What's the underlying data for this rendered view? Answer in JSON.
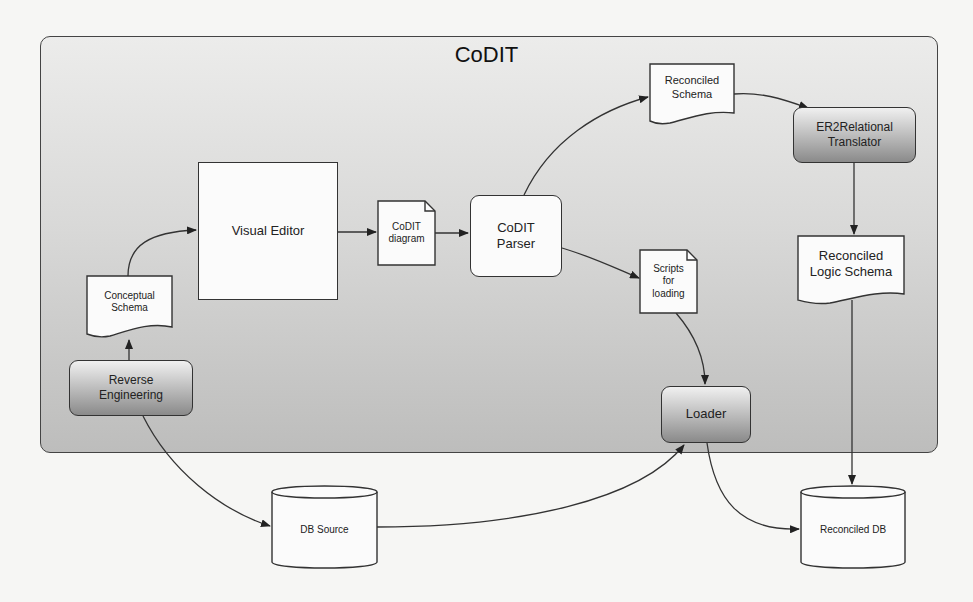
{
  "title": "CoDIT",
  "nodes": {
    "visual_editor": "Visual Editor",
    "codit_diagram": "CoDIT\ndiagram",
    "codit_parser": "CoDIT\nParser",
    "reconciled_schema": "Reconciled\nSchema",
    "er2relational_translator": "ER2Relational\nTranslator",
    "reconciled_logic_schema": "Reconciled\nLogic Schema",
    "scripts_for_loading": "Scripts\nfor\nloading",
    "loader": "Loader",
    "conceptual_schema": "Conceptual\nSchema",
    "reverse_engineering": "Reverse\nEngineering",
    "db_source": "DB Source",
    "reconciled_db": "Reconciled DB"
  },
  "edges": [
    {
      "from": "reverse_engineering",
      "to": "conceptual_schema"
    },
    {
      "from": "conceptual_schema",
      "to": "visual_editor"
    },
    {
      "from": "visual_editor",
      "to": "codit_diagram"
    },
    {
      "from": "codit_diagram",
      "to": "codit_parser"
    },
    {
      "from": "codit_parser",
      "to": "reconciled_schema"
    },
    {
      "from": "reconciled_schema",
      "to": "er2relational_translator"
    },
    {
      "from": "er2relational_translator",
      "to": "reconciled_logic_schema"
    },
    {
      "from": "reconciled_logic_schema",
      "to": "reconciled_db"
    },
    {
      "from": "codit_parser",
      "to": "scripts_for_loading"
    },
    {
      "from": "scripts_for_loading",
      "to": "loader"
    },
    {
      "from": "reverse_engineering",
      "to": "db_source"
    },
    {
      "from": "db_source",
      "to": "loader"
    },
    {
      "from": "loader",
      "to": "reconciled_db"
    }
  ]
}
